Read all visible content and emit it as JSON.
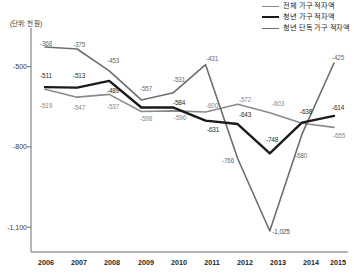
{
  "unit_note": "(단위: 천 원)",
  "legend": {
    "position": "top-right",
    "items": [
      {
        "label": "전체 가구 적자액",
        "color": "#8a8a8a",
        "width": 1.6
      },
      {
        "label": "청년 가구 적자액",
        "color": "#1a1a1a",
        "width": 2.4
      },
      {
        "label": "청년 단독 가구 적자액",
        "color": "#6e6e6e",
        "width": 1.6
      }
    ]
  },
  "axis": {
    "y_ticks": [
      "-500",
      "-800",
      "-1,100"
    ],
    "y_tick_values": [
      -500,
      -800,
      -1100
    ],
    "x_ticks": [
      "2006",
      "2007",
      "2008",
      "2009",
      "2010",
      "2011",
      "2012",
      "2013",
      "2014",
      "2015"
    ]
  },
  "chart_data": {
    "type": "line",
    "title": "",
    "xlabel": "",
    "ylabel": "(단위: 천 원)",
    "categories": [
      "2006",
      "2007",
      "2008",
      "2009",
      "2010",
      "2011",
      "2012",
      "2013",
      "2014",
      "2015"
    ],
    "ylim": [
      -1100,
      -300
    ],
    "grid": false,
    "legend_position": "top-right",
    "series": [
      {
        "name": "전체 가구 적자액",
        "color": "#8a8a8a",
        "values": [
          -519,
          -547,
          -537,
          -598,
          -596,
          -600,
          -572,
          -603,
          -640,
          -655
        ],
        "labels": [
          "-519",
          "-547",
          "-537",
          "-598",
          "-596",
          "-600",
          "-572",
          "-603",
          "-640",
          "-655"
        ]
      },
      {
        "name": "청년 가구 적자액",
        "color": "#1a1a1a",
        "values": [
          -511,
          -513,
          -489,
          -584,
          -584,
          -631,
          -643,
          -748,
          -638,
          -614
        ],
        "labels": [
          "-511",
          "-513",
          "-489",
          "-584",
          "-584",
          "-631",
          "-643",
          "-748",
          "-638",
          "-614"
        ]
      },
      {
        "name": "청년 단독 가구 적자액",
        "color": "#6e6e6e",
        "values": [
          -368,
          -375,
          -453,
          -557,
          -531,
          -431,
          -766,
          -1025,
          -680,
          -425
        ],
        "labels": [
          "-368",
          "-375",
          "-453",
          "-557",
          "-531",
          "-431",
          "-766",
          "-1,025",
          "-680",
          "-425"
        ]
      }
    ],
    "data_labels": [
      {
        "text": "-368",
        "x": 46,
        "y": 43,
        "color": "#6b6b6b"
      },
      {
        "text": "-375",
        "x": 79,
        "y": 44,
        "color": "#6b6b6b"
      },
      {
        "text": "-453",
        "x": 113,
        "y": 60,
        "color": "#6b6b6b"
      },
      {
        "text": "-557",
        "x": 146,
        "y": 88,
        "color": "#6b6b6b"
      },
      {
        "text": "-531",
        "x": 179,
        "y": 79,
        "color": "#6b6b6b"
      },
      {
        "text": "-431",
        "x": 212,
        "y": 58,
        "color": "#6b6b6b"
      },
      {
        "text": "-766",
        "x": 228,
        "y": 160,
        "color": "#6b6b6b"
      },
      {
        "text": "-1,025",
        "x": 281,
        "y": 231,
        "color": "#4a4a4a"
      },
      {
        "text": "-680",
        "x": 301,
        "y": 155,
        "color": "#6b6b6b"
      },
      {
        "text": "-425",
        "x": 338,
        "y": 57,
        "color": "#6b6b6b"
      },
      {
        "text": "-511",
        "x": 46,
        "y": 75,
        "color": "#2a2a2a"
      },
      {
        "text": "-513",
        "x": 79,
        "y": 75,
        "color": "#2a2a2a"
      },
      {
        "text": "-489",
        "x": 113,
        "y": 90,
        "color": "#2a2a2a"
      },
      {
        "text": "-584",
        "x": 179,
        "y": 102,
        "color": "#2a2a2a"
      },
      {
        "text": "-631",
        "x": 213,
        "y": 129,
        "color": "#2a2a2a"
      },
      {
        "text": "-643",
        "x": 245,
        "y": 114,
        "color": "#2a2a2a"
      },
      {
        "text": "-748",
        "x": 272,
        "y": 139,
        "color": "#2a2a2a"
      },
      {
        "text": "-638",
        "x": 306,
        "y": 111,
        "color": "#2a2a2a"
      },
      {
        "text": "-614",
        "x": 338,
        "y": 107,
        "color": "#2a2a2a"
      },
      {
        "text": "-519",
        "x": 46,
        "y": 105,
        "color": "#8a8a8a"
      },
      {
        "text": "-547",
        "x": 79,
        "y": 107,
        "color": "#8a8a8a"
      },
      {
        "text": "-537",
        "x": 113,
        "y": 106,
        "color": "#8a8a8a"
      },
      {
        "text": "-598",
        "x": 146,
        "y": 118,
        "color": "#8a8a8a"
      },
      {
        "text": "-596",
        "x": 180,
        "y": 117,
        "color": "#8a8a8a"
      },
      {
        "text": "-600",
        "x": 212,
        "y": 105,
        "color": "#8a8a8a"
      },
      {
        "text": "-572",
        "x": 245,
        "y": 99,
        "color": "#8a8a8a"
      },
      {
        "text": "-603",
        "x": 278,
        "y": 103,
        "color": "#8a8a8a"
      },
      {
        "text": "-655",
        "x": 339,
        "y": 135,
        "color": "#8a8a8a"
      }
    ]
  },
  "plot": {
    "left": 31,
    "right": 348,
    "top": 28,
    "bottom": 252,
    "axis_color": "#6f6f6f"
  }
}
